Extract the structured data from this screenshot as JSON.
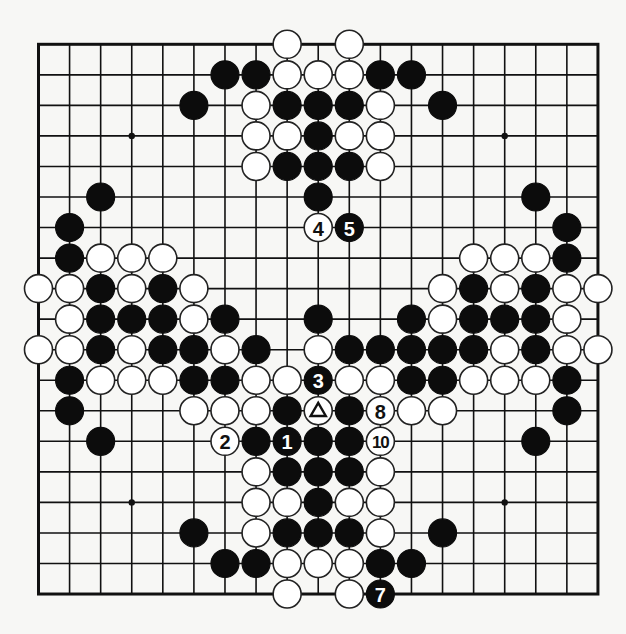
{
  "board": {
    "size": 19,
    "origin_x": 38.5,
    "origin_y": 44.3,
    "spacing_x": 31.08,
    "spacing_y": 30.54,
    "stone_radius": 14,
    "colors": {
      "black": "#0c0c0c",
      "white": "#ffffff",
      "line": "#111111",
      "background": "#f7f7f5"
    },
    "star_points": [
      [
        3,
        3
      ],
      [
        3,
        15
      ],
      [
        15,
        3
      ],
      [
        15,
        15
      ]
    ],
    "stones": [
      {
        "r": 0,
        "c": 8,
        "color": "W"
      },
      {
        "r": 0,
        "c": 10,
        "color": "W"
      },
      {
        "r": 1,
        "c": 6,
        "color": "B"
      },
      {
        "r": 1,
        "c": 7,
        "color": "B"
      },
      {
        "r": 1,
        "c": 8,
        "color": "W"
      },
      {
        "r": 1,
        "c": 9,
        "color": "W"
      },
      {
        "r": 1,
        "c": 10,
        "color": "W"
      },
      {
        "r": 1,
        "c": 11,
        "color": "B"
      },
      {
        "r": 1,
        "c": 12,
        "color": "B"
      },
      {
        "r": 2,
        "c": 5,
        "color": "B"
      },
      {
        "r": 2,
        "c": 7,
        "color": "W"
      },
      {
        "r": 2,
        "c": 8,
        "color": "B"
      },
      {
        "r": 2,
        "c": 9,
        "color": "B"
      },
      {
        "r": 2,
        "c": 10,
        "color": "B"
      },
      {
        "r": 2,
        "c": 11,
        "color": "W"
      },
      {
        "r": 2,
        "c": 13,
        "color": "B"
      },
      {
        "r": 3,
        "c": 7,
        "color": "W"
      },
      {
        "r": 3,
        "c": 8,
        "color": "W"
      },
      {
        "r": 3,
        "c": 9,
        "color": "B"
      },
      {
        "r": 3,
        "c": 10,
        "color": "W"
      },
      {
        "r": 3,
        "c": 11,
        "color": "W"
      },
      {
        "r": 4,
        "c": 7,
        "color": "W"
      },
      {
        "r": 4,
        "c": 8,
        "color": "B"
      },
      {
        "r": 4,
        "c": 9,
        "color": "B"
      },
      {
        "r": 4,
        "c": 10,
        "color": "B"
      },
      {
        "r": 4,
        "c": 11,
        "color": "W"
      },
      {
        "r": 5,
        "c": 2,
        "color": "B"
      },
      {
        "r": 5,
        "c": 9,
        "color": "B"
      },
      {
        "r": 5,
        "c": 16,
        "color": "B"
      },
      {
        "r": 6,
        "c": 1,
        "color": "B"
      },
      {
        "r": 6,
        "c": 9,
        "color": "W",
        "label": "4"
      },
      {
        "r": 6,
        "c": 10,
        "color": "B",
        "label": "5"
      },
      {
        "r": 6,
        "c": 17,
        "color": "B"
      },
      {
        "r": 7,
        "c": 1,
        "color": "B"
      },
      {
        "r": 7,
        "c": 2,
        "color": "W"
      },
      {
        "r": 7,
        "c": 3,
        "color": "W"
      },
      {
        "r": 7,
        "c": 4,
        "color": "W"
      },
      {
        "r": 7,
        "c": 14,
        "color": "W"
      },
      {
        "r": 7,
        "c": 15,
        "color": "W"
      },
      {
        "r": 7,
        "c": 16,
        "color": "W"
      },
      {
        "r": 7,
        "c": 17,
        "color": "B"
      },
      {
        "r": 8,
        "c": 0,
        "color": "W"
      },
      {
        "r": 8,
        "c": 1,
        "color": "W"
      },
      {
        "r": 8,
        "c": 2,
        "color": "B"
      },
      {
        "r": 8,
        "c": 3,
        "color": "W"
      },
      {
        "r": 8,
        "c": 4,
        "color": "B"
      },
      {
        "r": 8,
        "c": 5,
        "color": "W"
      },
      {
        "r": 8,
        "c": 13,
        "color": "W"
      },
      {
        "r": 8,
        "c": 14,
        "color": "B"
      },
      {
        "r": 8,
        "c": 15,
        "color": "W"
      },
      {
        "r": 8,
        "c": 16,
        "color": "B"
      },
      {
        "r": 8,
        "c": 17,
        "color": "W"
      },
      {
        "r": 8,
        "c": 18,
        "color": "W"
      },
      {
        "r": 9,
        "c": 1,
        "color": "W"
      },
      {
        "r": 9,
        "c": 2,
        "color": "B"
      },
      {
        "r": 9,
        "c": 3,
        "color": "B"
      },
      {
        "r": 9,
        "c": 4,
        "color": "B"
      },
      {
        "r": 9,
        "c": 5,
        "color": "W"
      },
      {
        "r": 9,
        "c": 6,
        "color": "B"
      },
      {
        "r": 9,
        "c": 9,
        "color": "B"
      },
      {
        "r": 9,
        "c": 12,
        "color": "B"
      },
      {
        "r": 9,
        "c": 13,
        "color": "W"
      },
      {
        "r": 9,
        "c": 14,
        "color": "B"
      },
      {
        "r": 9,
        "c": 15,
        "color": "B"
      },
      {
        "r": 9,
        "c": 16,
        "color": "B"
      },
      {
        "r": 9,
        "c": 17,
        "color": "W"
      },
      {
        "r": 10,
        "c": 0,
        "color": "W"
      },
      {
        "r": 10,
        "c": 1,
        "color": "W"
      },
      {
        "r": 10,
        "c": 2,
        "color": "B"
      },
      {
        "r": 10,
        "c": 3,
        "color": "W"
      },
      {
        "r": 10,
        "c": 4,
        "color": "B"
      },
      {
        "r": 10,
        "c": 5,
        "color": "B"
      },
      {
        "r": 10,
        "c": 6,
        "color": "W"
      },
      {
        "r": 10,
        "c": 7,
        "color": "B"
      },
      {
        "r": 10,
        "c": 9,
        "color": "W"
      },
      {
        "r": 10,
        "c": 10,
        "color": "B"
      },
      {
        "r": 10,
        "c": 11,
        "color": "B"
      },
      {
        "r": 10,
        "c": 12,
        "color": "B"
      },
      {
        "r": 10,
        "c": 13,
        "color": "B"
      },
      {
        "r": 10,
        "c": 14,
        "color": "B"
      },
      {
        "r": 10,
        "c": 15,
        "color": "W"
      },
      {
        "r": 10,
        "c": 16,
        "color": "B"
      },
      {
        "r": 10,
        "c": 17,
        "color": "W"
      },
      {
        "r": 10,
        "c": 18,
        "color": "W"
      },
      {
        "r": 11,
        "c": 1,
        "color": "B"
      },
      {
        "r": 11,
        "c": 2,
        "color": "W"
      },
      {
        "r": 11,
        "c": 3,
        "color": "W"
      },
      {
        "r": 11,
        "c": 4,
        "color": "W"
      },
      {
        "r": 11,
        "c": 5,
        "color": "B"
      },
      {
        "r": 11,
        "c": 6,
        "color": "B"
      },
      {
        "r": 11,
        "c": 7,
        "color": "W"
      },
      {
        "r": 11,
        "c": 8,
        "color": "W"
      },
      {
        "r": 11,
        "c": 9,
        "color": "B",
        "label": "3"
      },
      {
        "r": 11,
        "c": 10,
        "color": "W"
      },
      {
        "r": 11,
        "c": 11,
        "color": "W"
      },
      {
        "r": 11,
        "c": 12,
        "color": "B"
      },
      {
        "r": 11,
        "c": 13,
        "color": "B"
      },
      {
        "r": 11,
        "c": 14,
        "color": "W"
      },
      {
        "r": 11,
        "c": 15,
        "color": "W"
      },
      {
        "r": 11,
        "c": 16,
        "color": "W"
      },
      {
        "r": 11,
        "c": 17,
        "color": "B"
      },
      {
        "r": 12,
        "c": 1,
        "color": "B"
      },
      {
        "r": 12,
        "c": 5,
        "color": "W"
      },
      {
        "r": 12,
        "c": 6,
        "color": "W"
      },
      {
        "r": 12,
        "c": 7,
        "color": "W"
      },
      {
        "r": 12,
        "c": 8,
        "color": "B"
      },
      {
        "r": 12,
        "c": 9,
        "color": "W",
        "mark": "triangle"
      },
      {
        "r": 12,
        "c": 10,
        "color": "B"
      },
      {
        "r": 12,
        "c": 11,
        "color": "W",
        "label": "8"
      },
      {
        "r": 12,
        "c": 12,
        "color": "W"
      },
      {
        "r": 12,
        "c": 13,
        "color": "W"
      },
      {
        "r": 12,
        "c": 17,
        "color": "B"
      },
      {
        "r": 13,
        "c": 2,
        "color": "B"
      },
      {
        "r": 13,
        "c": 6,
        "color": "W",
        "label": "2"
      },
      {
        "r": 13,
        "c": 7,
        "color": "B"
      },
      {
        "r": 13,
        "c": 8,
        "color": "B",
        "label": "1"
      },
      {
        "r": 13,
        "c": 9,
        "color": "B"
      },
      {
        "r": 13,
        "c": 10,
        "color": "B"
      },
      {
        "r": 13,
        "c": 11,
        "color": "W",
        "label": "10"
      },
      {
        "r": 13,
        "c": 16,
        "color": "B"
      },
      {
        "r": 14,
        "c": 7,
        "color": "W"
      },
      {
        "r": 14,
        "c": 8,
        "color": "B"
      },
      {
        "r": 14,
        "c": 9,
        "color": "B"
      },
      {
        "r": 14,
        "c": 10,
        "color": "B"
      },
      {
        "r": 14,
        "c": 11,
        "color": "W"
      },
      {
        "r": 15,
        "c": 7,
        "color": "W"
      },
      {
        "r": 15,
        "c": 8,
        "color": "W"
      },
      {
        "r": 15,
        "c": 9,
        "color": "B"
      },
      {
        "r": 15,
        "c": 10,
        "color": "W"
      },
      {
        "r": 15,
        "c": 11,
        "color": "W"
      },
      {
        "r": 16,
        "c": 5,
        "color": "B"
      },
      {
        "r": 16,
        "c": 7,
        "color": "W"
      },
      {
        "r": 16,
        "c": 8,
        "color": "B"
      },
      {
        "r": 16,
        "c": 9,
        "color": "B"
      },
      {
        "r": 16,
        "c": 10,
        "color": "B"
      },
      {
        "r": 16,
        "c": 11,
        "color": "W"
      },
      {
        "r": 16,
        "c": 13,
        "color": "B"
      },
      {
        "r": 17,
        "c": 6,
        "color": "B"
      },
      {
        "r": 17,
        "c": 7,
        "color": "B"
      },
      {
        "r": 17,
        "c": 8,
        "color": "W"
      },
      {
        "r": 17,
        "c": 9,
        "color": "W"
      },
      {
        "r": 17,
        "c": 10,
        "color": "W"
      },
      {
        "r": 17,
        "c": 11,
        "color": "B"
      },
      {
        "r": 17,
        "c": 12,
        "color": "B"
      },
      {
        "r": 18,
        "c": 8,
        "color": "W"
      },
      {
        "r": 18,
        "c": 10,
        "color": "W"
      },
      {
        "r": 18,
        "c": 11,
        "color": "B",
        "label": "7"
      }
    ]
  }
}
